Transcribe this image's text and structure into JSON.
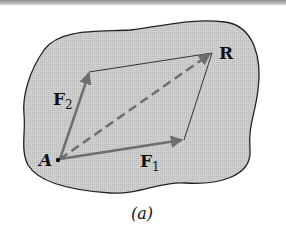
{
  "figure": {
    "caption": "(a)",
    "labels": {
      "point": "A",
      "force1": "F",
      "force1_sub": "1",
      "force2": "F",
      "force2_sub": "2",
      "resultant": "R"
    },
    "colors": {
      "body_fill": "#c9c9c9",
      "outline": "#222222",
      "vector": "#6e6e6e",
      "dashed": "#6e6e6e"
    }
  }
}
